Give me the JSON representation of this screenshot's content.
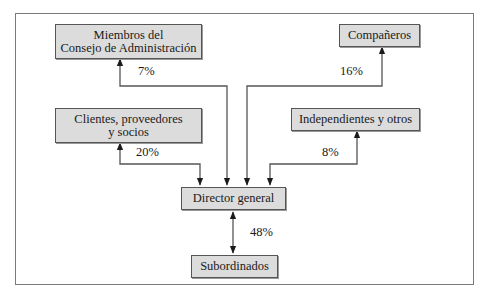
{
  "nodes": {
    "miembros": {
      "line1": "Miembros del",
      "line2": "Consejo de Administración"
    },
    "companeros": {
      "label": "Compañeros"
    },
    "clientes": {
      "line1": "Clientes, proveedores",
      "line2": "y socios"
    },
    "independientes": {
      "label": "Independientes y otros"
    },
    "director": {
      "label": "Director general"
    },
    "subordinados": {
      "label": "Subordinados"
    }
  },
  "edges": {
    "miembros_pct": "7%",
    "companeros_pct": "16%",
    "clientes_pct": "20%",
    "independientes_pct": "8%",
    "subordinados_pct": "48%"
  },
  "colors": {
    "box_fill": "#dcdcdc",
    "box_border": "#555555",
    "line": "#555555",
    "frame": "#7a7a7a"
  }
}
